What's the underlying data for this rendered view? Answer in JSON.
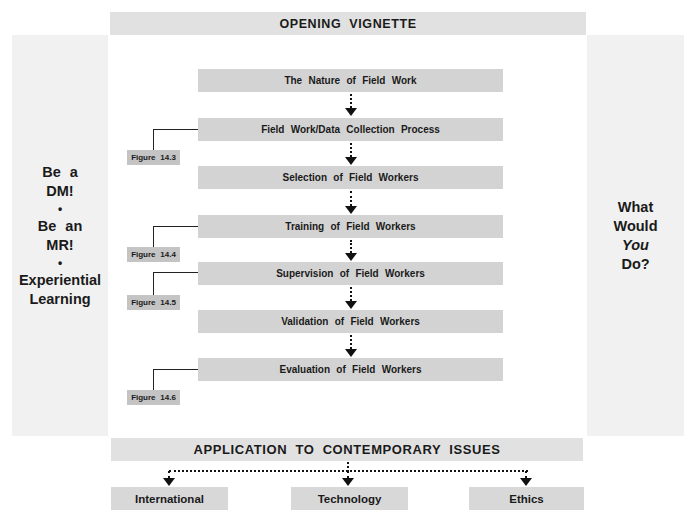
{
  "header": {
    "title": "OPENING VIGNETTE"
  },
  "left_panel": {
    "items": [
      "Be a",
      "DM!",
      "•",
      "Be an",
      "MR!",
      "•",
      "Experiential",
      "Learning"
    ]
  },
  "right_panel": {
    "lines": [
      "What",
      "Would",
      "You",
      "Do?"
    ]
  },
  "steps": [
    {
      "label": "The Nature of Field Work"
    },
    {
      "label": "Field Work/Data Collection Process",
      "figure": "Figure 14.3"
    },
    {
      "label": "Selection of Field Workers"
    },
    {
      "label": "Training of Field Workers",
      "figure": "Figure 14.4"
    },
    {
      "label": "Supervision of Field Workers",
      "figure": "Figure 14.5"
    },
    {
      "label": "Validation of Field Workers"
    },
    {
      "label": "Evaluation of Field Workers",
      "figure": "Figure 14.6"
    }
  ],
  "footer": {
    "title": "APPLICATION TO CONTEMPORARY ISSUES",
    "issues": [
      {
        "label": "International"
      },
      {
        "label": "Technology"
      },
      {
        "label": "Ethics"
      }
    ]
  },
  "colors": {
    "banner": "#e1e1e1",
    "side_panel": "#f1f1f1",
    "step_box": "#d3d3d3",
    "figure_label": "#c4c4c4",
    "text": "#1a1a1a"
  }
}
